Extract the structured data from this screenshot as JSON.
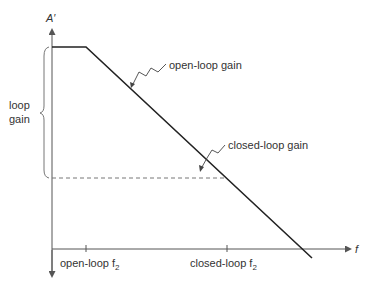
{
  "diagram": {
    "y_axis_label": "A′",
    "x_axis_label": "f",
    "annotations": {
      "open_loop_gain": "open-loop gain",
      "closed_loop_gain": "closed-loop gain",
      "loop_gain_line1": "loop",
      "loop_gain_line2": "gain"
    },
    "x_ticks": [
      {
        "label": "open-loop f",
        "subscript": "2"
      },
      {
        "label": "closed-loop f",
        "subscript": "2"
      }
    ],
    "colors": {
      "curve": "#222222",
      "axis": "#555555",
      "dashed": "#777777",
      "text": "#333333"
    }
  }
}
